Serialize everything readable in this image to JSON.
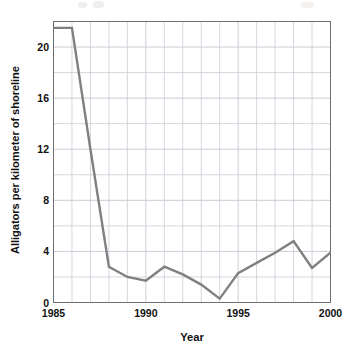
{
  "chart_data": {
    "type": "line",
    "title": "",
    "subtitle": "",
    "xlabel": "Year",
    "ylabel": "Alligators per kilometer of shoreline",
    "xlim": [
      1985,
      2000
    ],
    "ylim": [
      0,
      22
    ],
    "grid": true,
    "legend": null,
    "legend_position": "none",
    "xticks": [
      1985,
      1990,
      1995,
      2000
    ],
    "xtick_labels": [
      "1985",
      "1990",
      "1995",
      "2000"
    ],
    "yticks": [
      0,
      4,
      8,
      12,
      16,
      20
    ],
    "ytick_labels": [
      "0",
      "4",
      "8",
      "12",
      "16",
      "20"
    ],
    "x_minor_step": 1,
    "y_minor_step": 2,
    "line_color": "#808080",
    "grid_color": "#c9cdd6",
    "axis_color": "#6e6e6e",
    "x": [
      1985,
      1986,
      1987,
      1988,
      1989,
      1990,
      1991,
      1992,
      1993,
      1994,
      1995,
      1996,
      1997,
      1998,
      1999,
      2000
    ],
    "series": [
      {
        "name": "Alligators per kilometer of shoreline",
        "values": [
          21.5,
          21.5,
          12.0,
          2.8,
          2.0,
          1.7,
          2.8,
          2.2,
          1.4,
          0.3,
          2.3,
          3.1,
          3.9,
          4.8,
          2.7,
          3.9
        ]
      }
    ],
    "annotations": []
  },
  "axis_titles": {
    "x": "Year",
    "y": "Alligators per kilometer of shoreline"
  }
}
